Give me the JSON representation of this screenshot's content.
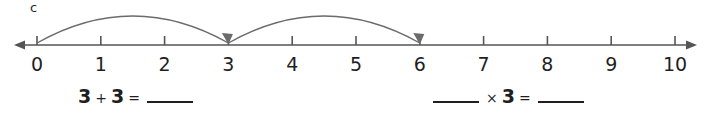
{
  "item": {
    "letter": "c"
  },
  "numberline": {
    "min": 0,
    "max": 10,
    "tick_labels": [
      "0",
      "1",
      "2",
      "3",
      "4",
      "5",
      "6",
      "7",
      "8",
      "9",
      "10"
    ],
    "line_color": "#555555",
    "arrow_left": true,
    "arrow_right": true,
    "jumps": [
      {
        "from": 0,
        "to": 3,
        "label": "jump-0-to-3"
      },
      {
        "from": 3,
        "to": 6,
        "label": "jump-3-to-6"
      }
    ],
    "jump_color": "#6b6b6b"
  },
  "equations": {
    "left": {
      "name": "addition-equation",
      "tokens": [
        {
          "type": "number",
          "text": "3"
        },
        {
          "type": "operator",
          "text": "+"
        },
        {
          "type": "number",
          "text": "3"
        },
        {
          "type": "operator",
          "text": "="
        },
        {
          "type": "blank",
          "text": ""
        }
      ]
    },
    "right": {
      "name": "multiplication-equation",
      "tokens": [
        {
          "type": "blank",
          "text": ""
        },
        {
          "type": "operator",
          "text": "×"
        },
        {
          "type": "number",
          "text": "3"
        },
        {
          "type": "operator",
          "text": "="
        },
        {
          "type": "blank",
          "text": ""
        }
      ]
    }
  }
}
